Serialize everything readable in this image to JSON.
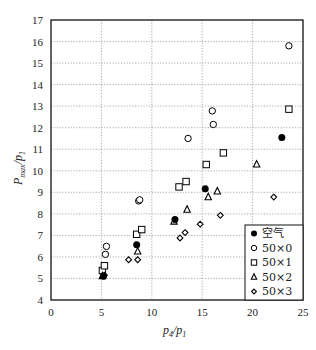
{
  "chart_data": {
    "type": "scatter",
    "title": "",
    "xlabel": "p4/p1",
    "ylabel": "Pmax/p1",
    "xlim": [
      0,
      25
    ],
    "ylim": [
      4,
      17
    ],
    "xticks": [
      0,
      5,
      10,
      15,
      20,
      25
    ],
    "yticks": [
      4,
      5,
      6,
      7,
      8,
      9,
      10,
      11,
      12,
      13,
      14,
      15,
      16,
      17
    ],
    "grid": true,
    "legend_position": "lower right",
    "series": [
      {
        "name": "空气",
        "marker": "filled-circle",
        "points": [
          [
            5.2,
            5.1
          ],
          [
            8.5,
            6.57
          ],
          [
            12.3,
            7.74
          ],
          [
            15.3,
            9.17
          ],
          [
            22.9,
            11.55
          ]
        ]
      },
      {
        "name": "50×0",
        "marker": "open-circle",
        "points": [
          [
            5.4,
            6.12
          ],
          [
            5.5,
            6.49
          ],
          [
            8.7,
            8.6
          ],
          [
            8.8,
            8.65
          ],
          [
            13.6,
            11.5
          ],
          [
            16.1,
            12.15
          ],
          [
            16.0,
            12.78
          ],
          [
            23.6,
            15.8
          ]
        ]
      },
      {
        "name": "50×1",
        "marker": "open-square",
        "points": [
          [
            5.1,
            5.37
          ],
          [
            5.3,
            5.59
          ],
          [
            8.5,
            7.05
          ],
          [
            9.0,
            7.27
          ],
          [
            12.7,
            9.25
          ],
          [
            13.4,
            9.5
          ],
          [
            15.4,
            10.29
          ],
          [
            17.1,
            10.83
          ],
          [
            23.6,
            12.86
          ]
        ]
      },
      {
        "name": "50×2",
        "marker": "open-triangle",
        "points": [
          [
            5.1,
            5.12
          ],
          [
            8.6,
            6.26
          ],
          [
            12.2,
            7.65
          ],
          [
            13.5,
            8.2
          ],
          [
            15.6,
            8.78
          ],
          [
            16.5,
            9.05
          ],
          [
            20.4,
            10.3
          ]
        ]
      },
      {
        "name": "50×3",
        "marker": "open-diamond",
        "points": [
          [
            5.3,
            5.15
          ],
          [
            7.7,
            5.87
          ],
          [
            8.6,
            5.87
          ],
          [
            12.8,
            6.88
          ],
          [
            13.3,
            7.13
          ],
          [
            14.8,
            7.52
          ],
          [
            16.8,
            7.93
          ],
          [
            22.1,
            8.78
          ]
        ]
      }
    ]
  },
  "legend": {
    "items": [
      "空气",
      "50×0",
      "50×1",
      "50×2",
      "50×3"
    ]
  },
  "axes": {
    "x_label_main": "p",
    "x_label_sub1": "4",
    "x_label_sep": "/p",
    "x_label_sub2": "1",
    "y_label_main": "P",
    "y_label_sub1": "max",
    "y_label_sep": "/p",
    "y_label_sub2": "1"
  }
}
